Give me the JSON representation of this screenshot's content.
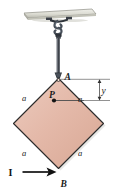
{
  "figure": {
    "colors": {
      "plate_fill": "#e3b6a6",
      "plate_fill_light": "#eccbbe",
      "plate_edge": "#2b2b2b",
      "ceiling_fill": "#d8d8cf",
      "ceiling_edge": "#8c8c84",
      "hook": "#4b5560",
      "cable": "#3c4048",
      "dimension_line": "#6e6e6e",
      "force_arrow": "#111111",
      "label_text": "#1a1a1a"
    },
    "labels": {
      "point_a": "A",
      "point_b": "B",
      "point_p": "P",
      "force": "I",
      "dimension_y": "y",
      "side_top_left": "a",
      "side_top_right": "a",
      "side_bottom_left": "a",
      "side_bottom_right": "a"
    },
    "icons": {
      "ceiling": "ceiling-plate-icon",
      "hook": "s-hook-icon",
      "cable": "cable-icon",
      "plate": "square-plate-icon",
      "force_arrow": "force-arrow-icon",
      "dimension_arrow_up": "dimension-arrow-up-icon",
      "dimension_arrow_down": "dimension-arrow-down-icon",
      "point_marker": "point-marker-icon"
    }
  }
}
